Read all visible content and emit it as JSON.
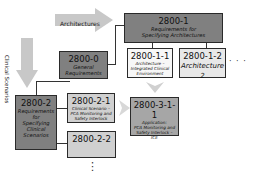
{
  "colors": {
    "dark_box": "#808080",
    "mid_box": "#a6a6a6",
    "light_box": "#e8e8e8",
    "white_box": "#f7f7f7",
    "arrow": "#c8c8c8"
  },
  "arrows": {
    "architectures": "Architectures",
    "clinical_scenarios": "Clinical Scenarios"
  },
  "boxes": {
    "b2800_1": {
      "id": "2800-1",
      "line1": "Requirements for",
      "line2": "Specifying Architectures"
    },
    "b2800_0": {
      "id": "2800-0",
      "line1": "General",
      "line2": "Requirements"
    },
    "b2800_1_1": {
      "id": "2800-1-1",
      "line1": "Architecture –",
      "line2": "Integrated Clinical",
      "line3": "Environment"
    },
    "b2800_1_2": {
      "id": "2800-1-2",
      "line1": "Architecture 2"
    },
    "b2800_2": {
      "id": "2800-2",
      "line1": "Requirements",
      "line2": "for",
      "line3": "Specifying",
      "line4": "Clinical",
      "line5": "Scenarios"
    },
    "b2800_2_1": {
      "id": "2800-2-1",
      "line1": "Clinical Scenario –",
      "line2": "PCA Monitoring and",
      "line3": "Safety Interlock"
    },
    "b2800_2_2": {
      "id": "2800-2-2"
    },
    "b2800_3_1_1": {
      "id": "2800-3-1-1",
      "line1": "Application:",
      "line2": "PCA Monitoring and",
      "line3": "Safety Interlock –",
      "line4": "ICE"
    }
  },
  "ellipsis": {
    "horizontal": "· · ·",
    "vertical": "⋮"
  }
}
